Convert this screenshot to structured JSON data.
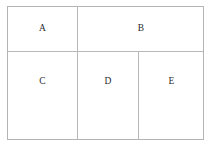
{
  "diagram": {
    "type": "partitioned-rectangle",
    "title": "",
    "canvas": {
      "width": 210,
      "height": 152,
      "background": "#ffffff"
    },
    "style": {
      "line_color": "#b4b4b4",
      "line_width": 1,
      "label_color": "#2a2a2a",
      "fill": "#ffffff"
    },
    "frame": {
      "left": 7,
      "top": 6,
      "right": 204,
      "bottom": 140
    },
    "dividers": [
      {
        "name": "row-divider",
        "orientation": "horizontal",
        "position": 51,
        "from": 7,
        "to": 204
      },
      {
        "name": "a-b-divider",
        "orientation": "vertical",
        "position": 77,
        "from": 6,
        "to": 51
      },
      {
        "name": "c-d-divider",
        "orientation": "vertical",
        "position": 77,
        "from": 51,
        "to": 140
      },
      {
        "name": "d-e-divider",
        "orientation": "vertical",
        "position": 138,
        "from": 51,
        "to": 140
      }
    ],
    "regions": [
      {
        "id": "a",
        "label": "A",
        "row": "top",
        "left": 7,
        "top": 6,
        "right": 77,
        "bottom": 51
      },
      {
        "id": "b",
        "label": "B",
        "row": "top",
        "left": 77,
        "top": 6,
        "right": 204,
        "bottom": 51
      },
      {
        "id": "c",
        "label": "C",
        "row": "bottom",
        "left": 7,
        "top": 51,
        "right": 77,
        "bottom": 140
      },
      {
        "id": "d",
        "label": "D",
        "row": "bottom",
        "left": 77,
        "top": 51,
        "right": 138,
        "bottom": 140
      },
      {
        "id": "e",
        "label": "E",
        "row": "bottom",
        "left": 138,
        "top": 51,
        "right": 204,
        "bottom": 140
      }
    ]
  }
}
